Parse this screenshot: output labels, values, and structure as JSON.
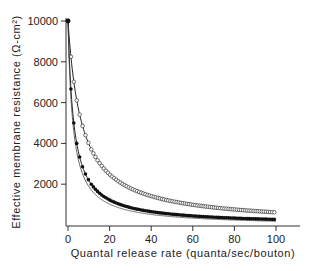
{
  "chart_data": {
    "type": "line",
    "title": "",
    "xlabel": "Quantal release rate (quanta/sec/bouton)",
    "ylabel": "Effective membrane resistance (Ω-cm²)",
    "xlim": [
      0,
      100
    ],
    "ylim": [
      0,
      10000
    ],
    "x_ticks": [
      0,
      20,
      40,
      60,
      80,
      100
    ],
    "y_ticks": [
      2000,
      4000,
      6000,
      8000,
      10000
    ],
    "grid": false,
    "legend": null,
    "series": [
      {
        "name": "open circles",
        "marker": "open-circle",
        "fit_line": true,
        "x": [
          0,
          1,
          2,
          3,
          4,
          5,
          7.5,
          10,
          15,
          20,
          30,
          40,
          50,
          60,
          70,
          80,
          90,
          100
        ],
        "values": [
          10000,
          8700,
          7700,
          6900,
          6200,
          5700,
          4700,
          4000,
          3050,
          2480,
          1800,
          1420,
          1170,
          990,
          860,
          760,
          680,
          620
        ]
      },
      {
        "name": "filled circles",
        "marker": "filled-circle",
        "fit_line": true,
        "x": [
          0,
          1,
          1.4,
          2,
          3,
          4,
          5,
          7.5,
          10,
          15,
          20,
          30,
          40,
          50,
          60,
          70,
          80,
          90,
          100
        ],
        "values": [
          10000,
          7400,
          6670,
          5800,
          4800,
          4100,
          3600,
          2700,
          2200,
          1570,
          1220,
          850,
          650,
          530,
          450,
          385,
          340,
          305,
          272
        ]
      }
    ]
  }
}
